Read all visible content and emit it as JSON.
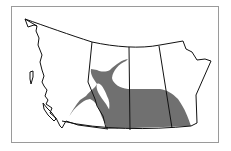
{
  "map": {
    "title": "Range map - Western Canada",
    "regions": [
      {
        "name": "British Columbia"
      },
      {
        "name": "Alberta"
      },
      {
        "name": "Saskatchewan"
      },
      {
        "name": "Manitoba"
      }
    ],
    "colors": {
      "range_fill": "#707070",
      "outline": "#111111",
      "frame": "#9a9a9a",
      "background": "#ffffff"
    }
  }
}
